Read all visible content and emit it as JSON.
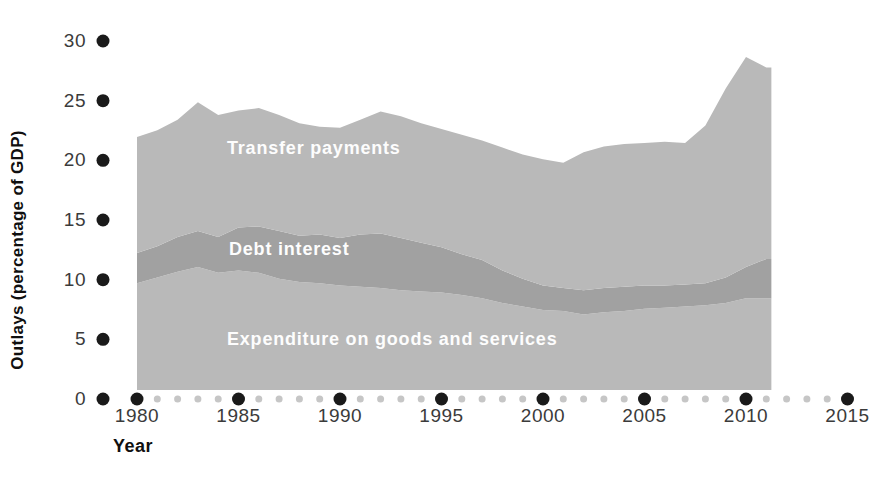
{
  "chart_data": {
    "type": "area",
    "stacked": true,
    "title": "",
    "xlabel": "Year",
    "ylabel": "Outlays (percentage of GDP)",
    "x": [
      1980,
      1981,
      1982,
      1983,
      1984,
      1985,
      1986,
      1987,
      1988,
      1989,
      1990,
      1991,
      1992,
      1993,
      1994,
      1995,
      1996,
      1997,
      1998,
      1999,
      2000,
      2001,
      2002,
      2003,
      2004,
      2005,
      2006,
      2007,
      2008,
      2009,
      2010,
      2011
    ],
    "series": [
      {
        "name": "Expenditure on goods and services",
        "color": "#b9b9b9",
        "values": [
          9.2,
          9.7,
          10.2,
          10.6,
          10.1,
          10.3,
          10.1,
          9.6,
          9.3,
          9.2,
          9.0,
          8.9,
          8.8,
          8.6,
          8.5,
          8.4,
          8.2,
          7.9,
          7.5,
          7.2,
          6.9,
          6.8,
          6.5,
          6.7,
          6.8,
          7.0,
          7.1,
          7.2,
          7.3,
          7.5,
          7.9,
          7.9
        ]
      },
      {
        "name": "Debt interest",
        "color": "#a1a1a1",
        "values": [
          2.6,
          2.7,
          3.0,
          3.1,
          3.1,
          3.7,
          4.0,
          4.1,
          4.0,
          4.2,
          4.1,
          4.5,
          4.7,
          4.5,
          4.2,
          3.9,
          3.5,
          3.3,
          2.8,
          2.4,
          2.1,
          2.0,
          2.1,
          2.1,
          2.1,
          2.0,
          1.9,
          1.9,
          1.9,
          2.2,
          2.7,
          3.4
        ]
      },
      {
        "name": "Transfer payments",
        "color": "#b9b9b9",
        "values": [
          10.0,
          10.0,
          10.1,
          11.1,
          10.5,
          10.1,
          10.2,
          10.0,
          9.7,
          9.3,
          9.5,
          9.9,
          10.5,
          10.5,
          10.3,
          10.2,
          10.3,
          10.3,
          10.6,
          10.7,
          10.9,
          10.8,
          11.9,
          12.2,
          12.3,
          12.3,
          12.4,
          12.2,
          13.6,
          16.3,
          18.1,
          16.5
        ]
      }
    ],
    "totals_note": "stacked total (percentage of GDP) rises from about 21.8 in 1980 to a peak of about 24.8 in 1983, about 24 in 1992, a low of about 19.6 in 2001, and a spike to about 28.7 in 2010, ending near 27.8 in 2011",
    "ylim": [
      0,
      30
    ],
    "y_ticks": [
      0,
      5,
      10,
      15,
      20,
      25,
      30
    ],
    "x_major_ticks": [
      1980,
      1985,
      1990,
      1995,
      2000,
      2005,
      2010,
      2015
    ],
    "x_minor_tick_years": "every year 1981-2014 not divisible by 5",
    "x_tick_range": [
      1980,
      2015
    ],
    "plot_end_year": 2011.25,
    "grid": false,
    "legend_position": "labels drawn inside areas",
    "colors": {
      "area_light": "#b9b9b9",
      "area_dark": "#a1a1a1",
      "tick_dot_black": "#1a1a1a",
      "tick_dot_gray": "#c6c6c6",
      "tick_text": "#3b3b3b",
      "axis_title_text": "#101010",
      "in_chart_label_text": "#fdfdfd",
      "background": "#ffffff"
    }
  }
}
